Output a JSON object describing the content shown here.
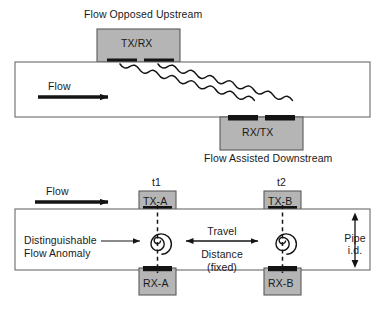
{
  "figure": {
    "background_color": "#ffffff",
    "line_color": "#1a1a1a",
    "transducer_fill": "#b5b5b5",
    "transducer_stroke": "#4d4d4d",
    "pad_color": "#141414"
  },
  "top_diagram": {
    "name": "transit-time-diagram",
    "upstream_caption": "Flow Opposed Upstream",
    "downstream_caption": "Flow Assisted Downstream",
    "flow_label": "Flow",
    "upper_transducer_label": "TX/RX",
    "lower_transducer_label": "RX/TX",
    "beam_count": 2,
    "beam_style": "wavy-diagonal"
  },
  "bottom_diagram": {
    "name": "vortex-tag-diagram",
    "flow_label": "Flow",
    "time_marker_1": "t1",
    "time_marker_2": "t2",
    "upper_transducer_a_label": "TX-A",
    "upper_transducer_b_label": "TX-B",
    "lower_transducer_a_label": "RX-A",
    "lower_transducer_b_label": "RX-B",
    "anomaly_label_line1": "Distinguishable",
    "anomaly_label_line2": "Flow Anomaly",
    "travel_label_line1": "Travel",
    "travel_label_line2": "Distance",
    "travel_label_line3": "(fixed)",
    "pipe_id_label_line1": "Pipe",
    "pipe_id_label_line2": "i.d.",
    "anomaly_count": 2,
    "anomaly_shape": "spiral-vortex"
  }
}
